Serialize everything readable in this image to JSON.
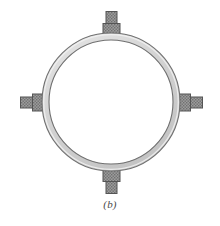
{
  "figure": {
    "caption": "(b)",
    "kind": "engineering-line-drawing",
    "background_color": "#ffffff"
  },
  "ring": {
    "label": "ring",
    "center_x": 111,
    "center_y": 102,
    "outer_radius": 69,
    "inner_radius": 62,
    "fill_color": "#d2d2d2",
    "stroke_color": "#6e6e6e",
    "highlight_color": "#efefef"
  },
  "brackets": [
    {
      "name": "top-bracket",
      "position": "top",
      "angle_deg": 90,
      "inner_block": {
        "width": 17,
        "height": 11,
        "fill": "#9a9a9a",
        "stroke": "#5a5a5a"
      },
      "outer_block": {
        "width": 11,
        "height": 12,
        "fill": "#8f8f8f",
        "stroke": "#5a5a5a"
      }
    },
    {
      "name": "right-bracket",
      "position": "right",
      "angle_deg": 0,
      "inner_block": {
        "width": 11,
        "height": 17,
        "fill": "#9a9a9a",
        "stroke": "#5a5a5a"
      },
      "outer_block": {
        "width": 12,
        "height": 11,
        "fill": "#8f8f8f",
        "stroke": "#5a5a5a"
      }
    },
    {
      "name": "bottom-bracket",
      "position": "bottom",
      "angle_deg": 270,
      "inner_block": {
        "width": 17,
        "height": 11,
        "fill": "#9a9a9a",
        "stroke": "#5a5a5a"
      },
      "outer_block": {
        "width": 11,
        "height": 12,
        "fill": "#8f8f8f",
        "stroke": "#5a5a5a"
      }
    },
    {
      "name": "left-bracket",
      "position": "left",
      "angle_deg": 180,
      "inner_block": {
        "width": 11,
        "height": 17,
        "fill": "#9a9a9a",
        "stroke": "#5a5a5a"
      },
      "outer_block": {
        "width": 12,
        "height": 11,
        "fill": "#8f8f8f",
        "stroke": "#5a5a5a"
      }
    }
  ]
}
